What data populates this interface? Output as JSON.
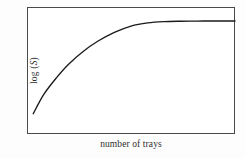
{
  "figure": {
    "background_color": "#fdfdfd",
    "plot_background_color": "#ffffff",
    "frame_color": "#4a4a4a",
    "curve_color": "#1a1a1a"
  },
  "axes": {
    "y_title_prefix": "log (",
    "y_title_variable": "S",
    "y_title_suffix": ")",
    "y_title_full": "log (S)",
    "x_title": "number of trays"
  },
  "chart_data": {
    "type": "line",
    "title": "",
    "subtitle": "",
    "xlabel": "number of trays",
    "ylabel": "log (S)",
    "legend": [],
    "legend_position": "none",
    "grid": false,
    "xticks": [],
    "yticks": [],
    "xtick_labels": [],
    "ytick_labels": [],
    "xlim": [
      0,
      1
    ],
    "ylim": [
      0,
      1
    ],
    "annotations": [],
    "series": [
      {
        "name": "species accumulation",
        "shape": "saturating / asymptotic rise to plateau",
        "x": [
          0.03,
          0.08,
          0.14,
          0.2,
          0.27,
          0.34,
          0.42,
          0.5,
          0.58,
          0.66,
          0.74,
          0.82,
          0.9,
          1.0
        ],
        "y": [
          0.16,
          0.31,
          0.44,
          0.55,
          0.65,
          0.73,
          0.8,
          0.85,
          0.875,
          0.885,
          0.888,
          0.889,
          0.89,
          0.89
        ]
      }
    ]
  }
}
